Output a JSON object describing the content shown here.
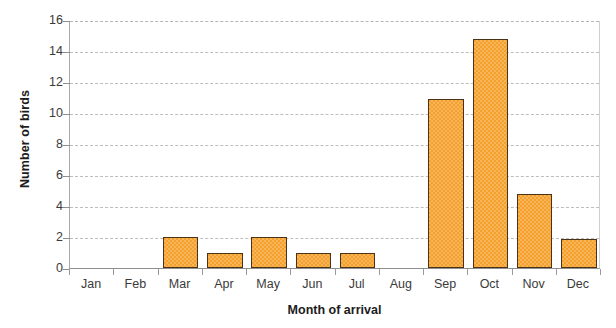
{
  "chart_data": {
    "type": "bar",
    "title": "",
    "xlabel": "Month of arrival",
    "ylabel": "Number of birds",
    "categories": [
      "Jan",
      "Feb",
      "Mar",
      "Apr",
      "May",
      "Jun",
      "Jul",
      "Aug",
      "Sep",
      "Oct",
      "Nov",
      "Dec"
    ],
    "values": [
      0,
      0,
      2.0,
      1.0,
      2.0,
      1.0,
      1.0,
      0,
      10.9,
      14.8,
      4.8,
      1.9
    ],
    "ylim": [
      0,
      16
    ],
    "ytick_labels": [
      "16",
      "14",
      "12",
      "10",
      "8",
      "6",
      "4",
      "2",
      "0"
    ],
    "ytick_values": [
      16,
      14,
      12,
      10,
      8,
      6,
      4,
      2,
      0
    ],
    "grid": true,
    "legend": "none",
    "bar_color": "#f5a02c",
    "bar_edge_color": "#4a3216",
    "grid_color": "#bdbdbd",
    "axis_color": "#8f8f8f"
  }
}
